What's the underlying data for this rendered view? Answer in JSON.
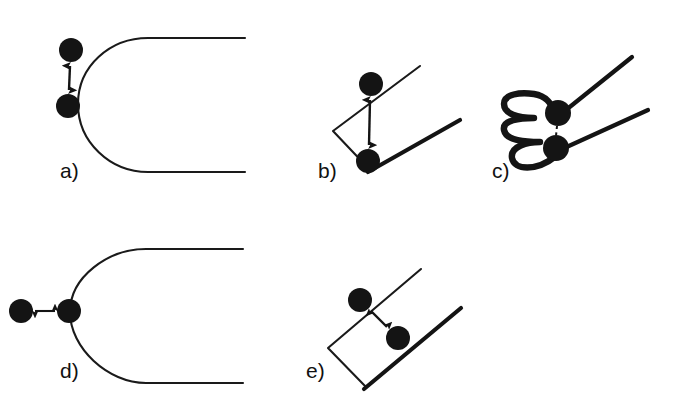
{
  "figure": {
    "width": 674,
    "height": 405,
    "background_color": "#ffffff",
    "ink_color": "#141414"
  },
  "panels": [
    {
      "id": "a",
      "label": "a)",
      "label_x": 60,
      "label_y": 178,
      "tip_type": "blunt-u-crack",
      "tip_opening": "right",
      "arrow_orientation": "vertical",
      "arrow_style": "double-headed-solid",
      "particle_count": 2,
      "particles": [
        {
          "cx": 71,
          "cy": 50,
          "r": 12
        },
        {
          "cx": 68,
          "cy": 106,
          "r": 12
        }
      ],
      "arrow": {
        "x1": 70,
        "y1": 66,
        "x2": 69,
        "y2": 90
      }
    },
    {
      "id": "b",
      "label": "b)",
      "label_x": 318,
      "label_y": 178,
      "tip_type": "sharp-wedge-crack",
      "tip_opening": "upper-right",
      "arrow_orientation": "vertical",
      "arrow_style": "double-headed-solid",
      "particle_count": 2,
      "particles": [
        {
          "cx": 371,
          "cy": 84,
          "r": 12
        },
        {
          "cx": 368,
          "cy": 161,
          "r": 12
        }
      ],
      "arrow": {
        "x1": 370,
        "y1": 100,
        "x2": 369,
        "y2": 145
      }
    },
    {
      "id": "c",
      "label": "c)",
      "label_x": 492,
      "label_y": 178,
      "tip_type": "crumpled-folded-crack",
      "tip_opening": "upper-right",
      "arrow_orientation": "vertical-short",
      "arrow_style": "dashed-bond",
      "particle_count": 2,
      "particles": [
        {
          "cx": 558,
          "cy": 113,
          "r": 13
        },
        {
          "cx": 556,
          "cy": 148,
          "r": 13
        }
      ],
      "arrow": {
        "x1": 557,
        "y1": 126,
        "x2": 556,
        "y2": 136
      }
    },
    {
      "id": "d",
      "label": "d)",
      "label_x": 60,
      "label_y": 378,
      "tip_type": "blunt-u-crack",
      "tip_opening": "right",
      "arrow_orientation": "horizontal",
      "arrow_style": "double-headed-solid",
      "particle_count": 2,
      "particles": [
        {
          "cx": 21,
          "cy": 311,
          "r": 12
        },
        {
          "cx": 69,
          "cy": 311,
          "r": 12
        }
      ],
      "arrow": {
        "x1": 35,
        "y1": 311,
        "x2": 55,
        "y2": 311
      }
    },
    {
      "id": "e",
      "label": "e)",
      "label_x": 306,
      "label_y": 378,
      "tip_type": "sharp-wedge-crack",
      "tip_opening": "upper-right",
      "arrow_orientation": "diagonal",
      "arrow_style": "double-headed-solid",
      "particle_count": 2,
      "particles": [
        {
          "cx": 360,
          "cy": 300,
          "r": 12
        },
        {
          "cx": 398,
          "cy": 338,
          "r": 12
        }
      ],
      "arrow": {
        "x1": 371,
        "y1": 311,
        "x2": 387,
        "y2": 327
      }
    }
  ],
  "geometry": {
    "panel_a_upper_arm": "M 245 38 L 148 38 C 110 38 78 66 78 104",
    "panel_a_lower_arm": "M 78 104 C 78 142 110 172 148 172 L 245 172",
    "panel_d_upper_arm": "M 243 249 L 146 249 C 108 249 70 277 70 312",
    "panel_d_lower_arm": "M 70 312 C 70 348 108 383 146 383 L 243 383",
    "panel_b_thin_flank": "M 370 170 L 333 131 L 420 66",
    "panel_b_thick_flank": "M 368 172 L 460 120",
    "panel_e_thin_flank": "M 366 387 L 328 348 L 421 269",
    "panel_e_thick_flank": "M 364 389 L 461 308",
    "panel_c_upper_flank": "M 556 118 L 632 57",
    "panel_c_lower_flank": "M 560 150 L 648 110",
    "panel_c_crumple": "M 556 156 C 536 172 514 170 512 158 C 510 146 528 142 540 142 C 522 142 506 140 504 130 C 502 120 520 118 534 118 C 518 118 504 114 504 104 C 504 94 520 92 534 94 C 546 96 552 104 554 112"
  }
}
